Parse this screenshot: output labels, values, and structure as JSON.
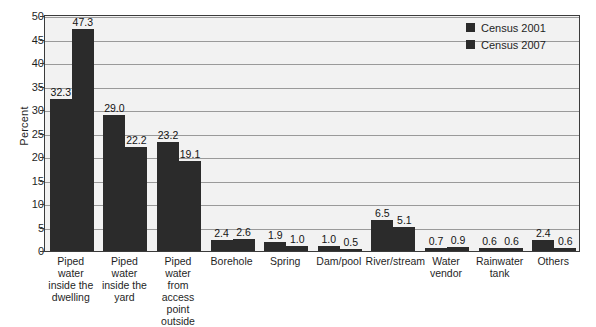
{
  "chart_data": {
    "type": "bar",
    "title": "",
    "xlabel": "",
    "ylabel": "Percent",
    "ylim": [
      0,
      50
    ],
    "yticks": [
      0,
      5,
      10,
      15,
      20,
      25,
      30,
      35,
      40,
      45,
      50
    ],
    "grid": true,
    "legend_position": "top-right",
    "categories": [
      "Piped water inside the dwelling",
      "Piped water inside the yard",
      "Piped water from access point outside",
      "Borehole",
      "Spring",
      "Dam/pool",
      "River/stream",
      "Water vendor",
      "Rainwater tank",
      "Others"
    ],
    "category_lines": [
      [
        "Piped water",
        "inside the",
        "dwelling"
      ],
      [
        "Piped water",
        "inside the",
        "yard"
      ],
      [
        "Piped water",
        "from access",
        "point outside"
      ],
      [
        "Borehole"
      ],
      [
        "Spring"
      ],
      [
        "Dam/pool"
      ],
      [
        "River/stream"
      ],
      [
        "Water",
        "vendor"
      ],
      [
        "Rainwater",
        "tank"
      ],
      [
        "Others"
      ]
    ],
    "series": [
      {
        "name": "Census 2001",
        "color": "#2b2b2b",
        "values": [
          32.3,
          29.0,
          23.2,
          2.4,
          1.9,
          1.0,
          6.5,
          0.7,
          0.6,
          2.4
        ],
        "labels": [
          "32.3",
          "29.0",
          "23.2",
          "2.4",
          "1.9",
          "1.0",
          "6.5",
          "0.7",
          "0.6",
          "2.4"
        ]
      },
      {
        "name": "Census 2007",
        "color": "#2b2b2b",
        "values": [
          47.3,
          22.2,
          19.1,
          2.6,
          1.0,
          0.5,
          5.1,
          0.9,
          0.6,
          0.6
        ],
        "labels": [
          "47.3",
          "22.2",
          "19.1",
          "2.6",
          "1.0",
          "0.5",
          "5.1",
          "0.9",
          "0.6",
          "0.6"
        ]
      }
    ]
  },
  "legend": {
    "items": [
      {
        "label": "Census 2001"
      },
      {
        "label": "Census 2007"
      }
    ]
  },
  "axis": {
    "y_title": "Percent",
    "y_tick_labels": [
      "0",
      "5",
      "10",
      "15",
      "20",
      "25",
      "30",
      "35",
      "40",
      "45",
      "50"
    ]
  },
  "colors": {
    "bar": "#2b2b2b",
    "plot_background": "#f2f2f2",
    "gridline": "#9a9a9a",
    "frame": "#3b3b3b",
    "text": "#1f1f1f"
  }
}
